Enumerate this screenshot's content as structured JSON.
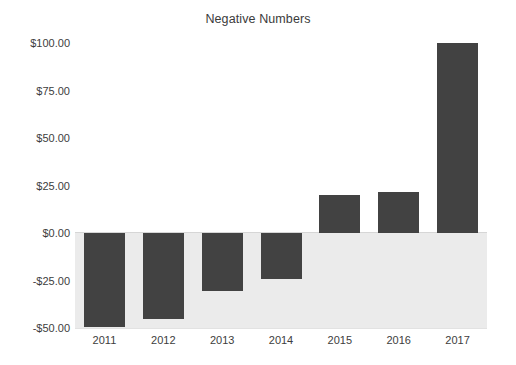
{
  "chart_data": {
    "type": "bar",
    "title": "Negative Numbers",
    "xlabel": "",
    "ylabel": "",
    "categories": [
      "2011",
      "2012",
      "2013",
      "2014",
      "2015",
      "2016",
      "2017"
    ],
    "values": [
      -49.5,
      -45,
      -30.5,
      -24,
      20,
      21.5,
      100
    ],
    "ylim": [
      -50,
      100
    ],
    "ytick_labels": [
      "$100.00",
      "$75.00",
      "$50.00",
      "$25.00",
      "$0.00",
      "-$25.00",
      "-$50.00"
    ],
    "ytick_values": [
      100,
      75,
      50,
      25,
      0,
      -25,
      -50
    ],
    "grid": false,
    "legend": null,
    "bar_color": "#424242",
    "negative_band_color": "#ebebeb",
    "background_color": "#ffffff",
    "axis_text_color": "#3d3d3d",
    "title_color": "#3b3b3b"
  }
}
